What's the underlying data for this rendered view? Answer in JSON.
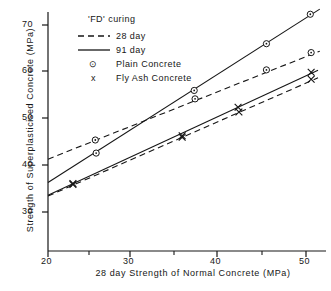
{
  "chart_data": {
    "type": "line",
    "title": "",
    "xlabel": "28 day Strength of Normal Concrete   (MPa)",
    "ylabel": "Strength of Superplasticised Concrete   (MPa)",
    "xlim": [
      20,
      52
    ],
    "ylim": [
      26,
      73.5
    ],
    "xticks": [
      20,
      30,
      40,
      50
    ],
    "xtick_labels": [
      "20",
      "30",
      "40",
      "50"
    ],
    "xminorticks": [
      25,
      35,
      45
    ],
    "yticks": [
      30,
      40,
      50,
      60,
      70
    ],
    "ytick_labels": [
      "30",
      "40",
      "50",
      "60",
      "70"
    ],
    "grid": false,
    "legend_position": "top-left",
    "legend_title": "'FD' curing",
    "legend_entries": [
      {
        "label": "28 day",
        "style": "dashed",
        "sample": "line"
      },
      {
        "label": "91 day",
        "style": "solid",
        "sample": "line"
      },
      {
        "label": "Plain  Concrete",
        "style": "marker",
        "sample": "circle"
      },
      {
        "label": "Fly Ash  Concrete",
        "style": "marker",
        "sample": "x"
      }
    ],
    "series": [
      {
        "name": "Plain Concrete - 91 day",
        "line_style": "solid",
        "marker": "circle",
        "line_x": [
          20,
          51.6
        ],
        "line_y": [
          36.3,
          73.4
        ],
        "points": [
          {
            "x": 25.6,
            "y": 42.6
          },
          {
            "x": 37.0,
            "y": 56.0
          },
          {
            "x": 45.4,
            "y": 66.0
          },
          {
            "x": 50.5,
            "y": 72.3
          }
        ]
      },
      {
        "name": "Plain Concrete - 28 day",
        "line_style": "dashed",
        "marker": "circle",
        "line_x": [
          20,
          51.6
        ],
        "line_y": [
          41.3,
          64.4
        ],
        "points": [
          {
            "x": 25.5,
            "y": 45.4
          },
          {
            "x": 37.1,
            "y": 54.2
          },
          {
            "x": 45.4,
            "y": 60.4
          },
          {
            "x": 50.6,
            "y": 64.1
          }
        ]
      },
      {
        "name": "Fly Ash Concrete - 91 day",
        "line_style": "solid",
        "marker": "x",
        "line_x": [
          20,
          51.4
        ],
        "line_y": [
          33.6,
          60.3
        ],
        "points": [
          {
            "x": 22.9,
            "y": 36.1
          },
          {
            "x": 35.6,
            "y": 46.3
          },
          {
            "x": 42.1,
            "y": 52.4
          },
          {
            "x": 50.6,
            "y": 59.9
          }
        ]
      },
      {
        "name": "Fly Ash Concrete - 28 day",
        "line_style": "dashed",
        "marker": "x",
        "line_x": [
          20,
          51.4
        ],
        "line_y": [
          33.4,
          58.7
        ],
        "points": [
          {
            "x": 22.9,
            "y": 35.9
          },
          {
            "x": 35.6,
            "y": 46.0
          },
          {
            "x": 42.2,
            "y": 51.4
          },
          {
            "x": 50.6,
            "y": 58.4
          }
        ]
      }
    ]
  },
  "axes": {
    "x_title": "28  day  Strength  of  Normal  Concrete    (MPa)",
    "y_title": "Strength  of  Superplasticised  Concrete    (MPa)",
    "x_tick_labels": [
      "20",
      "30",
      "40",
      "50"
    ],
    "y_tick_labels": [
      "30",
      "40",
      "50",
      "60",
      "70"
    ]
  },
  "legend": {
    "title": "'FD' curing",
    "day28_label": "28  day",
    "day91_label": "91 day",
    "plain_label": "Plain  Concrete",
    "flyash_label": "Fly Ash  Concrete",
    "plain_marker_glyph": "⊙",
    "flyash_marker_glyph": "x"
  },
  "colors": {
    "ink": "#161616",
    "background": "#ffffff"
  }
}
